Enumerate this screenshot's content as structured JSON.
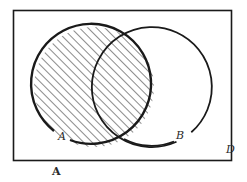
{
  "diagram": {
    "type": "venn",
    "universe_label": "D",
    "sets": [
      {
        "name": "A",
        "label": "A",
        "shaded": true,
        "stroke_width": 2.4
      },
      {
        "name": "B",
        "label": "B",
        "shaded": false,
        "stroke_width": 1.8
      }
    ],
    "shaded_region": "A",
    "caption": "A",
    "colors": {
      "stroke": "#1a1a1a",
      "hatch": "#2a2a2a",
      "background": "#ffffff"
    }
  }
}
